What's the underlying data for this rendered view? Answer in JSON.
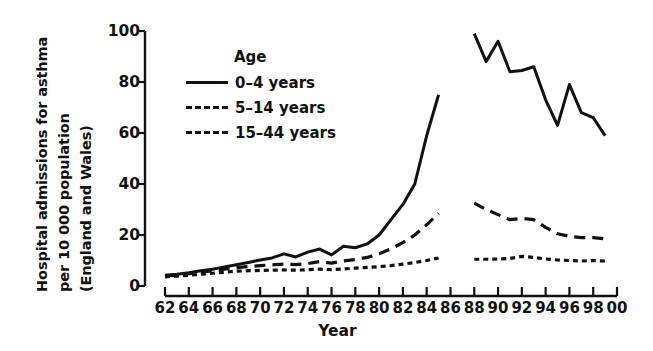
{
  "chart_data": {
    "type": "line",
    "title": "",
    "xlabel": "Year",
    "ylabel": "Hospital admissions for asthma per 10 000 population (England and Wales)",
    "ylabel_lines": [
      "Hospital admissions for asthma",
      "per 10 000 population",
      "(England and Wales)"
    ],
    "legend_title": "Age",
    "legend_position": "inside-top-left",
    "grid": false,
    "xlim": [
      1962,
      2000
    ],
    "ylim": [
      0,
      100
    ],
    "yticks": [
      0,
      20,
      40,
      60,
      80,
      100
    ],
    "ytick_labels": [
      "0",
      "20",
      "40",
      "60",
      "80",
      "100"
    ],
    "xticks": [
      1962,
      1964,
      1966,
      1968,
      1970,
      1972,
      1974,
      1976,
      1978,
      1980,
      1982,
      1984,
      1986,
      1988,
      1990,
      1992,
      1994,
      1996,
      1998,
      2000
    ],
    "xtick_labels": [
      "62",
      "64",
      "66",
      "68",
      "70",
      "72",
      "74",
      "76",
      "78",
      "80",
      "82",
      "84",
      "86",
      "88",
      "90",
      "92",
      "94",
      "96",
      "98",
      "00"
    ],
    "note": "Series are broken between 1985 and 1988 (no data plotted in the gap).",
    "series": [
      {
        "name": "0–4 years",
        "style": "solid",
        "color": "#111111",
        "segments": [
          {
            "x": [
              1962,
              1963,
              1964,
              1965,
              1966,
              1967,
              1968,
              1969,
              1970,
              1971,
              1972,
              1973,
              1974,
              1975,
              1976,
              1977,
              1978,
              1979,
              1980,
              1981,
              1982,
              1983,
              1984,
              1985
            ],
            "y": [
              4.2,
              4.6,
              5.2,
              6.0,
              6.6,
              7.5,
              8.3,
              9.2,
              10.2,
              11.0,
              12.6,
              11.4,
              13.3,
              14.5,
              12.2,
              15.6,
              15.0,
              16.5,
              20.0,
              26.0,
              32.0,
              40.0,
              59.0,
              75.0
            ]
          },
          {
            "x": [
              1988,
              1989,
              1990,
              1991,
              1992,
              1993,
              1994,
              1995,
              1996,
              1997,
              1998,
              1999
            ],
            "y": [
              99.0,
              88.0,
              96.0,
              84.0,
              84.5,
              86.0,
              73.0,
              63.0,
              79.0,
              68.0,
              66.0,
              59.0
            ]
          }
        ]
      },
      {
        "name": "5–14 years",
        "style": "dashed",
        "color": "#111111",
        "segments": [
          {
            "x": [
              1962,
              1963,
              1964,
              1965,
              1966,
              1967,
              1968,
              1969,
              1970,
              1971,
              1972,
              1973,
              1974,
              1975,
              1976,
              1977,
              1978,
              1979,
              1980,
              1981,
              1982,
              1983,
              1984,
              1985
            ],
            "y": [
              4.0,
              4.3,
              4.8,
              5.4,
              6.0,
              6.6,
              7.2,
              7.6,
              8.0,
              8.3,
              8.6,
              8.4,
              8.8,
              9.6,
              9.0,
              9.8,
              10.4,
              11.2,
              12.6,
              14.6,
              17.0,
              20.0,
              24.0,
              28.5
            ]
          },
          {
            "x": [
              1988,
              1989,
              1990,
              1991,
              1992,
              1993,
              1994,
              1995,
              1996,
              1997,
              1998,
              1999
            ],
            "y": [
              32.5,
              30.0,
              28.0,
              26.0,
              26.5,
              26.0,
              23.0,
              20.5,
              19.5,
              19.0,
              19.0,
              18.5
            ]
          }
        ]
      },
      {
        "name": "15–44 years",
        "style": "dotted",
        "color": "#111111",
        "segments": [
          {
            "x": [
              1962,
              1963,
              1964,
              1965,
              1966,
              1967,
              1968,
              1969,
              1970,
              1971,
              1972,
              1973,
              1974,
              1975,
              1976,
              1977,
              1978,
              1979,
              1980,
              1981,
              1982,
              1983,
              1984,
              1985
            ],
            "y": [
              3.6,
              3.9,
              4.2,
              4.6,
              5.0,
              5.4,
              5.8,
              6.0,
              6.1,
              6.2,
              6.3,
              6.2,
              6.4,
              6.6,
              6.4,
              6.7,
              7.0,
              7.3,
              7.6,
              8.0,
              8.6,
              9.2,
              10.0,
              11.0
            ]
          },
          {
            "x": [
              1988,
              1989,
              1990,
              1991,
              1992,
              1993,
              1994,
              1995,
              1996,
              1997,
              1998,
              1999
            ],
            "y": [
              10.5,
              10.5,
              10.6,
              10.8,
              11.6,
              11.2,
              10.6,
              10.2,
              10.0,
              9.8,
              10.0,
              9.8
            ]
          }
        ]
      }
    ]
  },
  "legend": {
    "title": "Age",
    "entries": [
      {
        "label": "0–4 years",
        "style": "solid"
      },
      {
        "label": "5–14 years",
        "style": "dashed"
      },
      {
        "label": "15–44 years",
        "style": "dotted"
      }
    ]
  },
  "axes": {
    "x_title": "Year"
  }
}
